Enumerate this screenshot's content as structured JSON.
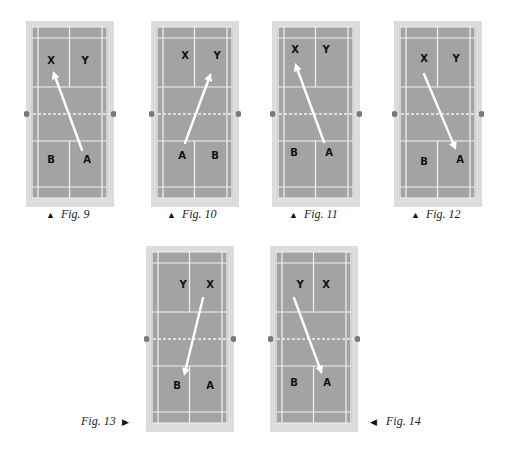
{
  "colors": {
    "court_border": "#dcdcdc",
    "court_surface": "#a3a3a3",
    "court_lines": "#f2f2f2",
    "net_post": "#7a7a7a",
    "arrow": "#ffffff",
    "caption_text": "#222222"
  },
  "figures": [
    {
      "id": "fig9",
      "caption": "Fig. 9",
      "caption_marker": "▲",
      "marker_position": "before",
      "origin": [
        26,
        21
      ],
      "top_half_players": [
        {
          "label": "X",
          "pos": [
            25,
            40
          ]
        },
        {
          "label": "Y",
          "pos": [
            59,
            40
          ]
        }
      ],
      "bottom_half_players": [
        {
          "label": "B",
          "pos": [
            25,
            139
          ]
        },
        {
          "label": "A",
          "pos": [
            61,
            139
          ]
        }
      ],
      "arrow": {
        "from": [
          56,
          129
        ],
        "to": [
          27,
          50
        ]
      }
    },
    {
      "id": "fig10",
      "caption": "Fig. 10",
      "caption_marker": "▲",
      "marker_position": "before",
      "origin": [
        151,
        21
      ],
      "top_half_players": [
        {
          "label": "X",
          "pos": [
            34,
            35
          ]
        },
        {
          "label": "Y",
          "pos": [
            66,
            35
          ]
        }
      ],
      "bottom_half_players": [
        {
          "label": "A",
          "pos": [
            31,
            135
          ]
        },
        {
          "label": "B",
          "pos": [
            64,
            135
          ]
        }
      ],
      "arrow": {
        "from": [
          34,
          122
        ],
        "to": [
          60,
          52
        ]
      }
    },
    {
      "id": "fig11",
      "caption": "Fig. 11",
      "caption_marker": "▲",
      "marker_position": "before",
      "origin": [
        272,
        21
      ],
      "top_half_players": [
        {
          "label": "X",
          "pos": [
            23,
            29
          ]
        },
        {
          "label": "Y",
          "pos": [
            54,
            29
          ]
        }
      ],
      "bottom_half_players": [
        {
          "label": "B",
          "pos": [
            22,
            132
          ]
        },
        {
          "label": "A",
          "pos": [
            57,
            132
          ]
        }
      ],
      "arrow": {
        "from": [
          52,
          121
        ],
        "to": [
          23,
          42
        ]
      }
    },
    {
      "id": "fig12",
      "caption": "Fig. 12",
      "caption_marker": "▲",
      "marker_position": "before",
      "origin": [
        394,
        21
      ],
      "top_half_players": [
        {
          "label": "X",
          "pos": [
            30,
            38
          ]
        },
        {
          "label": "Y",
          "pos": [
            62,
            38
          ]
        }
      ],
      "bottom_half_players": [
        {
          "label": "B",
          "pos": [
            30,
            141
          ]
        },
        {
          "label": "A",
          "pos": [
            66,
            139
          ]
        }
      ],
      "arrow": {
        "from": [
          30,
          53
        ],
        "to": [
          62,
          129
        ]
      }
    },
    {
      "id": "fig13",
      "caption": "Fig. 13",
      "caption_marker": "▶",
      "marker_position": "after",
      "origin": [
        146,
        246
      ],
      "top_half_players": [
        {
          "label": "Y",
          "pos": [
            37,
            39
          ]
        },
        {
          "label": "X",
          "pos": [
            64,
            39
          ]
        }
      ],
      "bottom_half_players": [
        {
          "label": "B",
          "pos": [
            31,
            140
          ]
        },
        {
          "label": "A",
          "pos": [
            64,
            140
          ]
        }
      ],
      "arrow": {
        "from": [
          57,
          52
        ],
        "to": [
          38,
          130
        ]
      }
    },
    {
      "id": "fig14",
      "caption": "Fig. 14",
      "caption_marker": "◀",
      "marker_position": "before",
      "origin": [
        270,
        246
      ],
      "top_half_players": [
        {
          "label": "Y",
          "pos": [
            30,
            39
          ]
        },
        {
          "label": "X",
          "pos": [
            56,
            39
          ]
        }
      ],
      "bottom_half_players": [
        {
          "label": "B",
          "pos": [
            24,
            137
          ]
        },
        {
          "label": "A",
          "pos": [
            57,
            137
          ]
        }
      ],
      "arrow": {
        "from": [
          24,
          52
        ],
        "to": [
          52,
          128
        ]
      }
    }
  ]
}
